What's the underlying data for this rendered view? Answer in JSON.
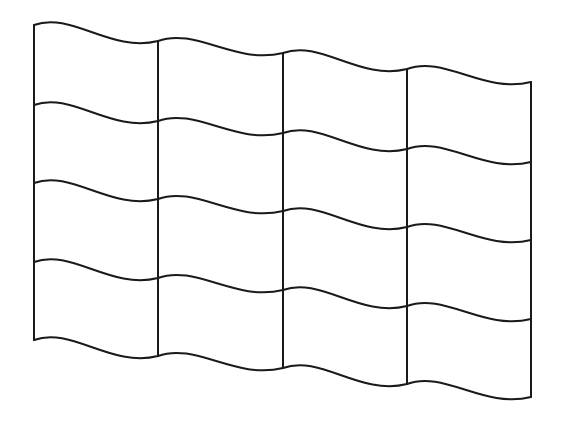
{
  "figure": {
    "columns": 4,
    "rows": 4,
    "stroke_color": "#1a1a1a",
    "background_color": "#ffffff",
    "column_x": [
      34,
      158,
      283,
      407,
      531
    ],
    "edge_y_left": [
      25,
      105,
      183,
      262,
      340
    ],
    "column_y_offset": [
      0,
      16,
      28,
      44,
      57
    ]
  }
}
